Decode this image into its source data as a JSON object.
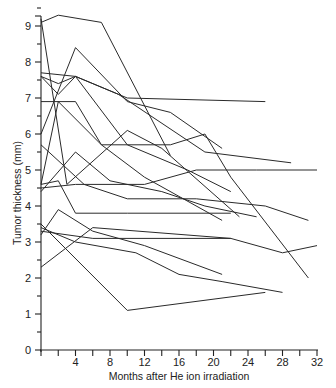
{
  "chart_data": {
    "type": "line",
    "title": "",
    "xlabel": "Months after He ion irradiation",
    "ylabel": "Tumor thickness (mm)",
    "xlim": [
      0,
      32
    ],
    "ylim": [
      0,
      9.6
    ],
    "x_ticks": [
      4,
      8,
      12,
      16,
      20,
      24,
      28,
      32
    ],
    "x_tick_labels": [
      "4",
      "8",
      "12",
      "16",
      "20",
      "24",
      "28",
      "32"
    ],
    "y_ticks": [
      0,
      1,
      2,
      3,
      4,
      5,
      6,
      7,
      8,
      9
    ],
    "y_tick_labels": [
      "0",
      "1",
      "2",
      "3",
      "4",
      "5",
      "6",
      "7",
      "8",
      "9"
    ],
    "grid": false,
    "legend": null,
    "series": [
      {
        "name": "patient-1",
        "x": [
          0,
          2,
          7,
          15
        ],
        "y": [
          9.1,
          9.3,
          9.1,
          5.4
        ]
      },
      {
        "name": "patient-2",
        "x": [
          0,
          3,
          10,
          14,
          23
        ],
        "y": [
          9.2,
          4.6,
          6.1,
          5.6,
          3.7
        ]
      },
      {
        "name": "patient-3",
        "x": [
          0,
          4,
          10,
          15,
          21
        ],
        "y": [
          6.0,
          8.4,
          6.9,
          6.6,
          5.6
        ]
      },
      {
        "name": "patient-4",
        "x": [
          0,
          2,
          4,
          10,
          26
        ],
        "y": [
          7.6,
          7.4,
          7.6,
          7.0,
          6.9
        ]
      },
      {
        "name": "patient-5",
        "x": [
          0,
          4,
          9,
          19,
          29
        ],
        "y": [
          7.7,
          7.6,
          7.1,
          5.5,
          5.2
        ]
      },
      {
        "name": "patient-6",
        "x": [
          0,
          2,
          4,
          10,
          17,
          22
        ],
        "y": [
          7.6,
          7.1,
          7.6,
          5.7,
          5.0,
          4.4
        ]
      },
      {
        "name": "patient-7",
        "x": [
          0,
          4,
          7,
          12,
          21
        ],
        "y": [
          6.9,
          6.9,
          5.7,
          4.8,
          3.6
        ]
      },
      {
        "name": "patient-8",
        "x": [
          0,
          2,
          7,
          15,
          19,
          22,
          31
        ],
        "y": [
          4.6,
          6.9,
          5.7,
          5.7,
          6.0,
          4.8,
          2.0
        ]
      },
      {
        "name": "patient-9",
        "x": [
          0,
          5,
          10,
          18,
          26,
          31
        ],
        "y": [
          5.7,
          4.6,
          4.2,
          4.2,
          4.0,
          3.6
        ]
      },
      {
        "name": "patient-10",
        "x": [
          0,
          4,
          8,
          14,
          19,
          25
        ],
        "y": [
          4.4,
          5.5,
          4.7,
          4.4,
          4.0,
          3.7
        ]
      },
      {
        "name": "patient-11",
        "x": [
          0,
          4,
          12,
          18,
          25,
          32
        ],
        "y": [
          4.5,
          4.6,
          4.6,
          5.0,
          5.0,
          5.0
        ]
      },
      {
        "name": "patient-12",
        "x": [
          0,
          2,
          4,
          10,
          22
        ],
        "y": [
          4.6,
          4.7,
          3.8,
          3.8,
          3.8
        ]
      },
      {
        "name": "patient-13",
        "x": [
          0,
          2,
          6,
          12,
          21
        ],
        "y": [
          3.2,
          3.9,
          3.3,
          2.9,
          2.1
        ]
      },
      {
        "name": "patient-14",
        "x": [
          0,
          4,
          11,
          16,
          21,
          28
        ],
        "y": [
          3.4,
          3.0,
          2.7,
          2.1,
          1.9,
          1.6
        ]
      },
      {
        "name": "patient-15",
        "x": [
          0,
          10,
          26
        ],
        "y": [
          3.5,
          1.1,
          1.6
        ]
      },
      {
        "name": "patient-16",
        "x": [
          0,
          6,
          22,
          28,
          32
        ],
        "y": [
          2.3,
          3.4,
          3.1,
          2.7,
          2.9
        ]
      },
      {
        "name": "patient-17",
        "x": [
          0,
          6,
          22
        ],
        "y": [
          3.3,
          3.1,
          3.1
        ]
      }
    ]
  },
  "axes": {
    "x_title": "Months after He ion irradiation",
    "y_title": "Tumor thickness (mm)"
  }
}
